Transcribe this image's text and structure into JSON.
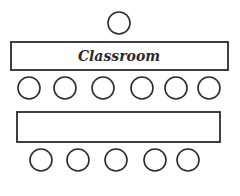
{
  "diagram": {
    "title": "Classroom",
    "teacher_seats": 1,
    "rows": [
      {
        "table_label": "Classroom",
        "seats_below": 6
      },
      {
        "table_label": "",
        "seats_below": 5
      }
    ]
  }
}
